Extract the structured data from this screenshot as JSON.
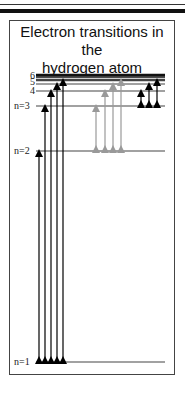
{
  "title": "Electron transitions in the hydrogen atom",
  "title_lines": [
    "Electron transitions in the",
    "hydrogen atom"
  ],
  "levels": [
    {
      "n": 1,
      "label": "n=1",
      "y": 362
    },
    {
      "n": 2,
      "label": "n=2",
      "y": 151
    },
    {
      "n": 3,
      "label": "n=3",
      "y": 106
    },
    {
      "n": 4,
      "label": "4",
      "y": 91
    },
    {
      "n": 5,
      "label": "5",
      "y": 84
    },
    {
      "n": 6,
      "label": "6",
      "y": 80
    }
  ],
  "series": [
    {
      "name": "Lyman",
      "lower": 1,
      "color": "#000000",
      "transitions": [
        2,
        3,
        4,
        5,
        6
      ]
    },
    {
      "name": "Balmer",
      "lower": 2,
      "color": "#999999",
      "transitions": [
        3,
        4,
        5,
        6
      ]
    },
    {
      "name": "Paschen",
      "lower": 3,
      "color": "#000000",
      "transitions": [
        4,
        5,
        6
      ]
    }
  ],
  "colors": {
    "lyman": "#000000",
    "balmer": "#999999",
    "paschen": "#000000",
    "level_line": "#444444"
  }
}
